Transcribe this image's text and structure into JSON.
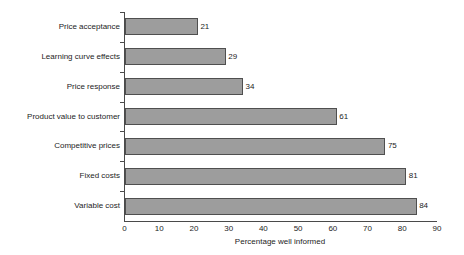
{
  "chart_data": {
    "type": "bar",
    "orientation": "horizontal",
    "title": "",
    "xlabel": "Percentage well informed",
    "ylabel": "",
    "categories": [
      "Price acceptance",
      "Learning curve effects",
      "Price response",
      "Product value to customer",
      "Competitive prices",
      "Fixed costs",
      "Variable cost"
    ],
    "values": [
      21,
      29,
      34,
      61,
      75,
      81,
      84
    ],
    "data_labels": [
      "21",
      "29",
      "34",
      "61",
      "75",
      "81",
      "84"
    ],
    "xlim": [
      0,
      90
    ],
    "xticks": [
      0,
      10,
      20,
      30,
      40,
      50,
      60,
      70,
      80,
      90
    ],
    "xtick_labels": [
      "0",
      "10",
      "20",
      "30",
      "40",
      "50",
      "60",
      "70",
      "80",
      "90"
    ],
    "grid": false,
    "legend": null,
    "colors": {
      "bar_fill": "#9d9d9d",
      "bar_border": "#4f4f4f",
      "axis": "#4a4a4a",
      "text": "#1d1d1d",
      "background": "#ffffff"
    }
  }
}
